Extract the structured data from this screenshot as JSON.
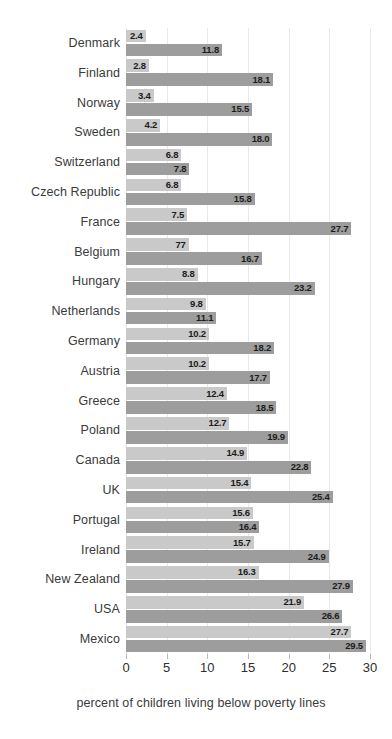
{
  "chart_data": {
    "type": "bar",
    "orientation": "horizontal",
    "title": "",
    "subtitle": "",
    "xlabel": "percent of children living below poverty lines",
    "ylabel": "",
    "xlim": [
      0,
      30
    ],
    "ylim": null,
    "grid": true,
    "grid_axis": "x",
    "legend": false,
    "legend_position": "none",
    "xticks": [
      "0",
      "5",
      "10",
      "15",
      "20",
      "25",
      "30"
    ],
    "xtick_values": [
      0,
      5,
      10,
      15,
      20,
      25,
      30
    ],
    "categories": [
      "Denmark",
      "Finland",
      "Norway",
      "Sweden",
      "Switzerland",
      "Czech Republic",
      "France",
      "Belgium",
      "Hungary",
      "Netherlands",
      "Germany",
      "Austria",
      "Greece",
      "Poland",
      "Canada",
      "UK",
      "Portugal",
      "Ireland",
      "New Zealand",
      "USA",
      "Mexico"
    ],
    "series": [
      {
        "name": "series-1",
        "color": "#c9c9c9",
        "values": [
          2.4,
          2.8,
          3.4,
          4.2,
          6.8,
          6.8,
          7.5,
          7.7,
          8.8,
          9.8,
          10.2,
          10.2,
          12.4,
          12.7,
          14.9,
          15.4,
          15.6,
          15.7,
          16.3,
          21.9,
          27.7
        ],
        "labels": [
          "2.4",
          "2.8",
          "3.4",
          "4.2",
          "6.8",
          "6.8",
          "7.5",
          "77",
          "8.8",
          "9.8",
          "10.2",
          "10.2",
          "12.4",
          "12.7",
          "14.9",
          "15.4",
          "15.6",
          "15.7",
          "16.3",
          "21.9",
          "27.7"
        ]
      },
      {
        "name": "series-2",
        "color": "#9d9d9d",
        "values": [
          11.8,
          18.1,
          15.5,
          18.0,
          7.8,
          15.8,
          27.7,
          16.7,
          23.2,
          11.1,
          18.2,
          17.7,
          18.5,
          19.9,
          22.8,
          25.4,
          16.4,
          24.9,
          27.9,
          26.6,
          29.5
        ],
        "labels": [
          "11.8",
          "18.1",
          "15.5",
          "18.0",
          "7.8",
          "15.8",
          "27.7",
          "16.7",
          "23.2",
          "11.1",
          "18.2",
          "17.7",
          "18.5",
          "19.9",
          "22.8",
          "25.4",
          "16.4",
          "24.9",
          "27.9",
          "26.6",
          "29.5"
        ]
      }
    ]
  },
  "colors": {
    "series_light": "#c9c9c9",
    "series_dark": "#9d9d9d",
    "gridline": "#e9e9e9",
    "label_text": "#3a3a3a",
    "value_text": "#1c1c1c",
    "background": "#ffffff"
  }
}
